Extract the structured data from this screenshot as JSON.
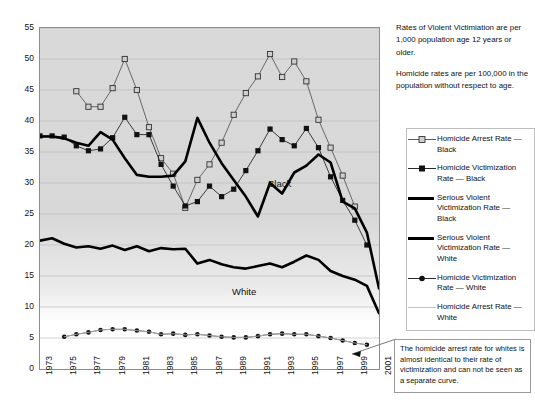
{
  "notes": {
    "violent": "Rates of Violent Victimiation are per 1,000 population age 12 years or older.",
    "homicide": "Homicide rates are per 100,000 in the population without respect to age."
  },
  "callout": {
    "text": "The homicide arrest rate for whites is almost identical to their rate of victimization and can not be seen as a separate curve."
  },
  "legend": {
    "items": [
      {
        "key": "open-square-line",
        "label": "Homicide Arrest Rate — Black"
      },
      {
        "key": "filled-square-line",
        "label": "Homicide Victimization Rate — Black"
      },
      {
        "key": "thick-line",
        "label": "Serious Violent Victimization Rate — Black"
      },
      {
        "key": "thick-line",
        "label": "Serious Violent Victimization Rate — White"
      },
      {
        "key": "filled-dot-line",
        "label": "Homicide Victimization Rate — White"
      },
      {
        "key": "thin-line",
        "label": "Homicide Arrest Rate — White"
      }
    ]
  },
  "annotations": [
    {
      "name": "black-series-label",
      "text": "Black",
      "x": 268,
      "y": 178
    },
    {
      "name": "white-series-label",
      "text": "White",
      "x": 232,
      "y": 286
    }
  ],
  "chart_data": {
    "type": "line",
    "title": "",
    "xlabel": "",
    "ylabel": "",
    "xlim": [
      1973,
      2001
    ],
    "ylim": [
      0,
      55
    ],
    "ytick_step": 5,
    "grid": true,
    "legend_position": "right",
    "x": [
      1973,
      1974,
      1975,
      1976,
      1977,
      1978,
      1979,
      1980,
      1981,
      1982,
      1983,
      1984,
      1985,
      1986,
      1987,
      1988,
      1989,
      1990,
      1991,
      1992,
      1993,
      1994,
      1995,
      1996,
      1997,
      1998,
      1999,
      2000,
      2001
    ],
    "xtick_labels": [
      "1973",
      "1975",
      "1977",
      "1979",
      "1981",
      "1983",
      "1985",
      "1987",
      "1989",
      "1991",
      "1993",
      "1995",
      "1997",
      "1999",
      "2001"
    ],
    "series": [
      {
        "name": "Homicide Arrest Rate — Black",
        "marker": "open-square",
        "color": "#4a4a4a",
        "values": [
          null,
          null,
          null,
          44.8,
          42.3,
          42.3,
          45.3,
          50.0,
          45.0,
          39.0,
          34.0,
          31.5,
          26.0,
          30.5,
          33.0,
          36.5,
          41.0,
          44.5,
          47.2,
          50.8,
          47.1,
          49.6,
          46.4,
          40.2,
          35.7,
          31.2,
          26.2,
          null,
          null
        ]
      },
      {
        "name": "Homicide Victimization Rate — Black",
        "marker": "filled-square",
        "color": "#111111",
        "values": [
          37.6,
          37.6,
          37.4,
          36.0,
          35.2,
          35.5,
          37.3,
          40.6,
          37.8,
          37.8,
          33.0,
          29.5,
          26.3,
          27.0,
          29.5,
          27.8,
          29.0,
          32.0,
          35.2,
          38.7,
          37.0,
          36.0,
          38.8,
          35.7,
          31.0,
          27.2,
          24.0,
          20.0,
          null
        ]
      },
      {
        "name": "Serious Violent Victimization Rate — Black",
        "marker": "none",
        "color": "#000000",
        "width": "thick",
        "values": [
          37.5,
          37.5,
          37.2,
          36.5,
          36.0,
          38.2,
          37.0,
          34.0,
          31.3,
          31.0,
          31.0,
          31.2,
          33.5,
          40.5,
          36.5,
          33.2,
          30.5,
          27.8,
          24.6,
          30.0,
          28.3,
          31.7,
          32.8,
          34.6,
          33.3,
          27.0,
          25.9,
          22.0,
          13.0
        ]
      },
      {
        "name": "Serious Violent Victimization Rate — White",
        "marker": "none",
        "color": "#000000",
        "width": "thick",
        "values": [
          20.7,
          21.1,
          20.2,
          19.6,
          19.8,
          19.4,
          19.9,
          19.2,
          19.8,
          19.0,
          19.5,
          19.3,
          19.4,
          17.0,
          17.6,
          16.9,
          16.4,
          16.2,
          16.6,
          17.0,
          16.4,
          17.3,
          18.3,
          17.6,
          15.8,
          15.0,
          14.4,
          13.4,
          9.0
        ]
      },
      {
        "name": "Homicide Victimization Rate — White",
        "marker": "filled-dot",
        "color": "#111111",
        "values": [
          null,
          null,
          5.2,
          5.6,
          5.9,
          6.3,
          6.4,
          6.4,
          6.2,
          6.0,
          5.6,
          5.7,
          5.5,
          5.6,
          5.4,
          5.2,
          5.1,
          5.1,
          5.3,
          5.6,
          5.7,
          5.6,
          5.6,
          5.3,
          5.0,
          4.6,
          4.2,
          3.9,
          null
        ]
      },
      {
        "name": "Homicide Arrest Rate — White",
        "marker": "none",
        "color": "#bcbcbc",
        "width": "thin",
        "values": [
          null,
          null,
          5.2,
          5.6,
          5.9,
          6.3,
          6.4,
          6.4,
          6.2,
          6.0,
          5.6,
          5.7,
          5.5,
          5.6,
          5.4,
          5.2,
          5.1,
          5.1,
          5.3,
          5.6,
          5.7,
          5.6,
          5.6,
          5.3,
          5.0,
          4.6,
          4.2,
          3.9,
          null
        ]
      }
    ]
  }
}
